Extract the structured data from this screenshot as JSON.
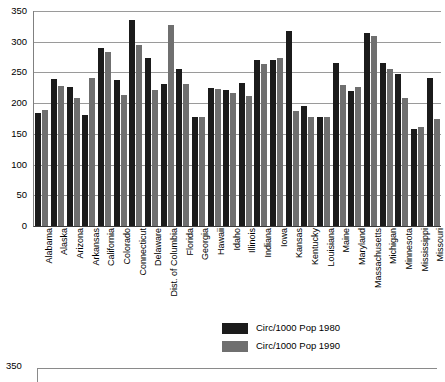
{
  "chart_data": {
    "type": "bar",
    "title": "",
    "xlabel": "",
    "ylabel": "",
    "ylim": [
      0,
      350
    ],
    "yticks": [
      0,
      50,
      100,
      150,
      200,
      250,
      300,
      350
    ],
    "grid": true,
    "legend_position": "bottom-center",
    "colors": {
      "series_1980": "#1b1b1b",
      "series_1990": "#6f6f6f",
      "gridline": "#9a9a9a",
      "axis": "#3a3a3a",
      "background": "#ffffff"
    },
    "categories": [
      "Alabama",
      "Alaska",
      "Arizona",
      "Arkansas",
      "California",
      "Colorado",
      "Connecticut",
      "Delaware",
      "Dist. of Columbia",
      "Florida",
      "Georgia",
      "Hawaii",
      "Idaho",
      "Illinois",
      "Indiana",
      "Iowa",
      "Kansas",
      "Kentucky",
      "Louisiana",
      "Maine",
      "Maryland",
      "Massachusetts",
      "Michigan",
      "Minnesota",
      "Mississippi",
      "Missouri"
    ],
    "series": [
      {
        "name": "Circ/1000 Pop 1980",
        "color": "#1b1b1b",
        "values": [
          184,
          239,
          226,
          181,
          290,
          238,
          336,
          274,
          232,
          255,
          178,
          225,
          221,
          233,
          271,
          270,
          318,
          196,
          178,
          265,
          219,
          314,
          265,
          247,
          158,
          241
        ]
      },
      {
        "name": "Circ/1000 Pop 1990",
        "color": "#6f6f6f",
        "values": [
          189,
          228,
          209,
          241,
          284,
          213,
          294,
          221,
          328,
          232,
          178,
          223,
          216,
          211,
          264,
          274,
          188,
          178,
          178,
          229,
          226,
          310,
          256,
          209,
          161,
          175
        ]
      }
    ],
    "legend": [
      {
        "label": "Circ/1000 Pop 1980",
        "swatch": "#1b1b1b"
      },
      {
        "label": "Circ/1000 Pop 1990",
        "swatch": "#6f6f6f"
      }
    ]
  },
  "secondary_chart": {
    "top_tick_label": "350"
  }
}
